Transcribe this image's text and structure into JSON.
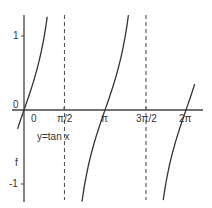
{
  "chart_data": {
    "type": "line",
    "title": "",
    "function_label": "y=tan x",
    "y_axis_name": "f",
    "xlabel": "",
    "ylabel": "f",
    "x_ticks": [
      "0",
      "π/2",
      "π",
      "3π/2",
      "2π"
    ],
    "x_tick_values": [
      0,
      1.5708,
      3.1416,
      4.7124,
      6.2832
    ],
    "y_ticks": [
      "1",
      "0",
      "-1"
    ],
    "y_tick_values": [
      1,
      0,
      -1
    ],
    "asymptotes": [
      1.5708,
      4.7124
    ],
    "asymptote_labels": [
      "π/2",
      "3π/2"
    ],
    "xlim": [
      -0.3,
      7.0
    ],
    "ylim": [
      -1.25,
      1.3
    ],
    "grid": false,
    "series": [
      {
        "name": "y=tan x",
        "x": [
          -0.25,
          0,
          0.4,
          0.8,
          0.9
        ],
        "y": [
          -0.26,
          0,
          0.42,
          1.03,
          1.26
        ]
      },
      {
        "name": "y=tan x branch 2",
        "x": [
          2.25,
          2.7,
          3.1416,
          3.6,
          4.05
        ],
        "y": [
          -1.24,
          -0.47,
          0,
          0.49,
          1.28
        ]
      },
      {
        "name": "y=tan x branch 3",
        "x": [
          5.4,
          5.9,
          6.2832,
          6.6
        ],
        "y": [
          -1.24,
          -0.4,
          0,
          0.33
        ]
      }
    ],
    "colors": {
      "curve": "#333333",
      "axis": "#444444",
      "asymptote": "#555555"
    }
  }
}
